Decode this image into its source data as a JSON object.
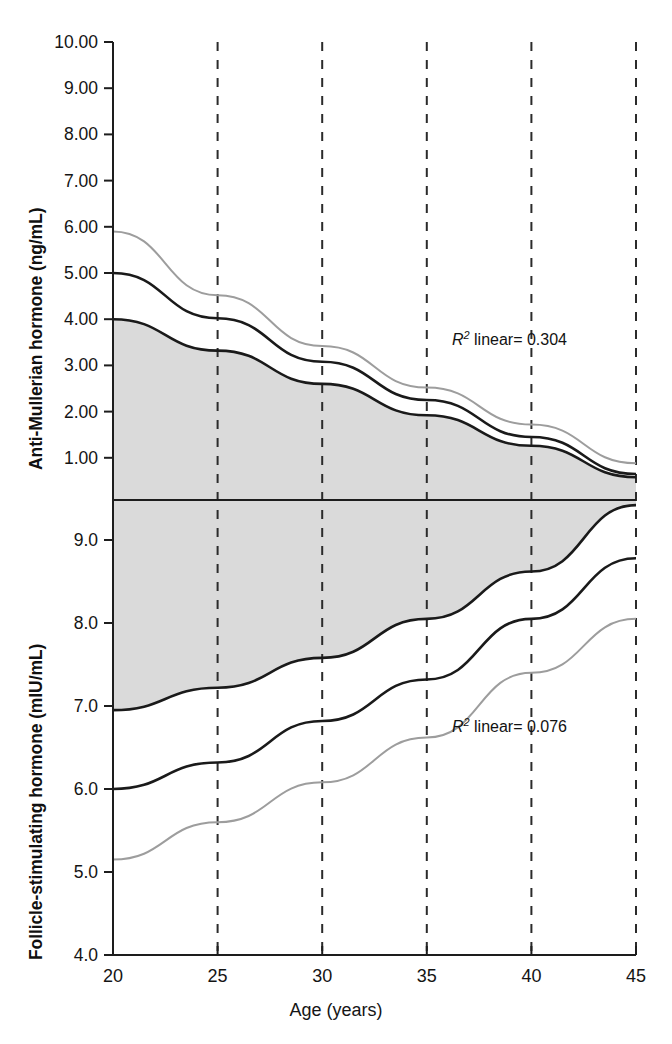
{
  "figure": {
    "xlabel": "Age (years)",
    "background": "#ffffff"
  },
  "colors": {
    "band_fill": "#dadada",
    "band_edge": "#1a1a1a",
    "mean_line": "#1a1a1a",
    "secondary_line": "#9d9d9d",
    "gridline": "#2b2b2b",
    "axis": "#1d1d1d",
    "text": "#141414"
  },
  "panels": {
    "upper": {
      "ylabel": "Anti-Mullerian hormone (ng/mL)",
      "unit": "ng/mL",
      "yticks": [
        "10.00",
        "9.00",
        "8.00",
        "7.00",
        "6.00",
        "5.00",
        "4.00",
        "3.00",
        "2.00",
        "1.00"
      ],
      "annotation_r2": "linear= 0.304",
      "annotation_prefix": "R",
      "annotation_exp": "2"
    },
    "lower": {
      "ylabel": "Follicle-stimulating hormone (mIU/mL)",
      "unit": "mIU/mL",
      "yticks": [
        "9.0",
        "8.0",
        "7.0",
        "6.0",
        "5.0",
        "4.0"
      ],
      "annotation_r2": "linear= 0.076",
      "annotation_prefix": "R",
      "annotation_exp": "2"
    }
  },
  "xticks": [
    "20",
    "25",
    "30",
    "35",
    "40",
    "45"
  ],
  "chart_data": [
    {
      "type": "line",
      "panel": "upper",
      "title": "Anti-Mullerian hormone vs Age",
      "xlabel": "Age (years)",
      "ylabel": "Anti-Mullerian hormone (ng/mL)",
      "xlim": [
        20,
        45
      ],
      "ylim": [
        0.0,
        10.0
      ],
      "yticks": [
        1.0,
        2.0,
        3.0,
        4.0,
        5.0,
        6.0,
        7.0,
        8.0,
        9.0,
        10.0
      ],
      "xticks": [
        20,
        25,
        30,
        35,
        40,
        45
      ],
      "grid": "vertical-dashed",
      "legend": "none",
      "annotations": [
        {
          "text": "R2 linear= 0.304",
          "x": 36.5,
          "y": 3.55
        }
      ],
      "x": [
        20,
        25,
        30,
        35,
        40,
        45
      ],
      "series": [
        {
          "name": "upper-gray-curve",
          "color": "#9d9d9d",
          "style": "solid-thin",
          "values": [
            5.9,
            4.52,
            3.42,
            2.52,
            1.72,
            0.88
          ]
        },
        {
          "name": "mean-regression",
          "color": "#1a1a1a",
          "style": "solid",
          "values": [
            5.0,
            4.02,
            3.08,
            2.25,
            1.45,
            0.65
          ]
        },
        {
          "name": "band-upper-edge",
          "color": "#1a1a1a",
          "style": "solid",
          "values": [
            5.0,
            4.02,
            3.08,
            2.25,
            1.45,
            0.65
          ]
        },
        {
          "name": "band-lower-edge",
          "color": "#1a1a1a",
          "style": "solid",
          "values": [
            4.0,
            3.32,
            2.6,
            1.92,
            1.26,
            0.58
          ]
        }
      ],
      "shaded_band": {
        "name": "confidence-band",
        "fill": "#dadada",
        "upper": [
          4.0,
          3.32,
          2.6,
          1.92,
          1.26,
          0.58
        ],
        "lower": [
          0.0,
          0.0,
          0.0,
          0.0,
          0.0,
          0.0
        ]
      }
    },
    {
      "type": "line",
      "panel": "lower",
      "title": "Follicle-stimulating hormone vs Age",
      "xlabel": "Age (years)",
      "ylabel": "Follicle-stimulating hormone (mIU/mL)",
      "xlim": [
        20,
        45
      ],
      "ylim": [
        4.0,
        9.55
      ],
      "yticks": [
        4.0,
        5.0,
        6.0,
        7.0,
        8.0,
        9.0
      ],
      "xticks": [
        20,
        25,
        30,
        35,
        40,
        45
      ],
      "grid": "vertical-dashed",
      "legend": "none",
      "annotations": [
        {
          "text": "R2 linear= 0.076",
          "x": 36.5,
          "y": 6.75
        }
      ],
      "x": [
        20,
        25,
        30,
        35,
        40,
        45
      ],
      "series": [
        {
          "name": "mean-regression",
          "color": "#1a1a1a",
          "style": "solid",
          "values": [
            6.0,
            6.32,
            6.82,
            7.32,
            8.05,
            8.78
          ]
        },
        {
          "name": "lower-gray-curve",
          "color": "#9d9d9d",
          "style": "solid-thin",
          "values": [
            5.15,
            5.6,
            6.08,
            6.62,
            7.4,
            8.05
          ]
        },
        {
          "name": "band-lower-edge",
          "color": "#1a1a1a",
          "style": "solid",
          "values": [
            6.95,
            7.22,
            7.58,
            8.05,
            8.62,
            9.42
          ]
        }
      ],
      "shaded_band": {
        "name": "confidence-band",
        "fill": "#dadada",
        "upper": [
          9.55,
          9.55,
          9.55,
          9.55,
          9.55,
          9.42
        ],
        "lower": [
          6.95,
          7.22,
          7.58,
          8.05,
          8.62,
          9.42
        ]
      }
    }
  ]
}
